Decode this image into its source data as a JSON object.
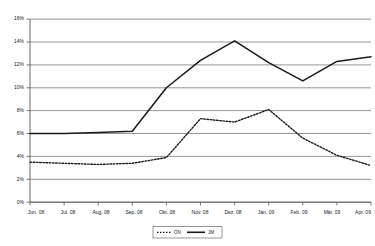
{
  "chart_data": {
    "type": "line",
    "title": "",
    "subtitle": "",
    "xlabel": "",
    "ylabel": "",
    "grid": true,
    "legend_position": "bottom",
    "categories": [
      "Jun. 08",
      "Jul. 08",
      "Aug. 08",
      "Sep. 08",
      "Okt. 08",
      "Nov. 08",
      "Dez. 08",
      "Jän. 09",
      "Feb. 09",
      "Mär. 09",
      "Apr. 09"
    ],
    "ylim": [
      0,
      16
    ],
    "yticks": [
      0,
      2,
      4,
      6,
      8,
      10,
      12,
      14,
      16
    ],
    "ytick_labels": [
      "0%",
      "2%",
      "4%",
      "6%",
      "8%",
      "10%",
      "12%",
      "14%",
      "16%"
    ],
    "series": [
      {
        "name": "ÖN",
        "style": "dotted",
        "values": [
          3.5,
          3.4,
          3.3,
          3.4,
          3.9,
          7.3,
          7.0,
          8.1,
          5.6,
          4.1,
          3.2
        ]
      },
      {
        "name": "JM",
        "style": "solid",
        "values": [
          6.0,
          6.0,
          6.1,
          6.2,
          10.0,
          12.4,
          14.1,
          12.2,
          10.6,
          12.3,
          12.7
        ]
      }
    ]
  },
  "legend": {
    "entries": [
      {
        "label": "ÖN",
        "style": "dotted"
      },
      {
        "label": "JM",
        "style": "solid"
      }
    ]
  },
  "axes": {
    "y_tick_labels": [
      "16%",
      "14%",
      "12%",
      "10%",
      "8%",
      "6%",
      "4%",
      "2%",
      "0%"
    ],
    "x_tick_labels": [
      "Jun. 08",
      "Jul. 08",
      "Aug. 08",
      "Sep. 08",
      "Okt. 08",
      "Nov. 08",
      "Dez. 08",
      "Jän. 09",
      "Feb. 09",
      "Mär. 09",
      "Apr. 09"
    ]
  }
}
